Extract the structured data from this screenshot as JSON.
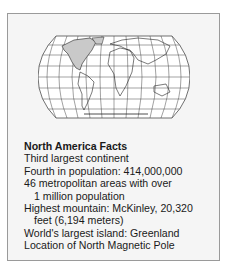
{
  "figure": {
    "map": {
      "projection": "robinson-style world map",
      "highlighted_region": "North America",
      "highlight_color": "#c9c9c9",
      "grid_color": "#333333"
    },
    "facts": {
      "title": "North America Facts",
      "lines": [
        {
          "text": "Third largest continent",
          "indent": false
        },
        {
          "text": "Fourth in population: 414,000,000",
          "indent": false
        },
        {
          "text": "46 metropolitan areas with over",
          "indent": false
        },
        {
          "text": "1 million population",
          "indent": true
        },
        {
          "text": "Highest mountain: McKinley, 20,320",
          "indent": false
        },
        {
          "text": "feet (6,194 meters)",
          "indent": true
        },
        {
          "text": "World's largest island: Greenland",
          "indent": false
        },
        {
          "text": "Location of North Magnetic Pole",
          "indent": false
        }
      ]
    }
  }
}
